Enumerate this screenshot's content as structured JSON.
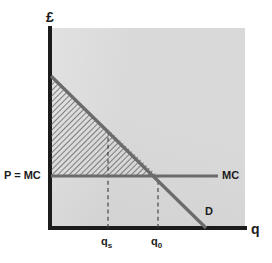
{
  "figure": {
    "type": "economics-diagram"
  },
  "axes": {
    "y_title": "£",
    "x_title": "q",
    "origin": {
      "x": 51,
      "y": 228
    },
    "x_max_px": 245,
    "y_top_px": 28,
    "axis_color": "#1b1b1b",
    "panel_color": "#d9d9d9"
  },
  "curves": {
    "demand": {
      "label": "D",
      "color": "#6b6b6b",
      "start": {
        "x": 51,
        "y": 76
      },
      "end": {
        "x": 206,
        "y": 228
      }
    },
    "marginal_cost": {
      "label": "MC",
      "color": "#6b6b6b",
      "y_px": 176,
      "x_start": 51,
      "x_end": 218
    }
  },
  "labels": {
    "price_mc": "P = MC",
    "mc": "MC",
    "demand": "D"
  },
  "ticks": {
    "qs": {
      "text": "q",
      "sub": "s",
      "x_px": 108
    },
    "q0": {
      "text": "q",
      "sub": "0",
      "x_px": 158
    }
  },
  "shaded_region": {
    "name": "consumer-surplus",
    "pattern": "diagonal-hatch",
    "hatch_color": "#4a4a4a"
  }
}
